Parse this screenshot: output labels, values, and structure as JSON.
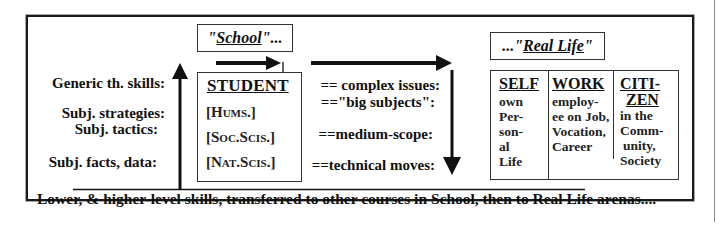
{
  "diagram": {
    "school_title": {
      "quote_open": "\"",
      "word": "School",
      "suffix": "\"..."
    },
    "real_life_title": {
      "prefix": "...\"",
      "word": "Real Life",
      "quote_close": "\""
    },
    "left_labels": [
      "Generic th. skills:",
      "Subj. strategies:",
      "Subj. tactics:",
      "Subj. facts, data:"
    ],
    "student_box": {
      "title": "STUDENT",
      "subjects": [
        "[Hums.]",
        "[Soc.Scis.]",
        "[Nat.Scis.]"
      ]
    },
    "middle_labels": [
      "== complex issues:",
      "==\"big subjects\":",
      "==medium-scope:",
      "==technical moves:"
    ],
    "arenas": [
      {
        "title": "SELF",
        "lines": [
          "own",
          "Per-",
          "son-",
          "al",
          "Life"
        ]
      },
      {
        "title": "WORK",
        "lines": [
          "employ-",
          "ee on Job,",
          "Vocation,",
          "Career"
        ]
      },
      {
        "title_lines": [
          "CITI-",
          "ZEN"
        ],
        "lines": [
          "in the",
          "Comm-",
          "unity,",
          "Society"
        ]
      }
    ],
    "bottom_caption": "Lower, & higher-level skills, transferred to other courses in School, then to Real Life arenas....",
    "colors": {
      "ink": "#111111",
      "frame": "#1a1a1a",
      "right_rule": "#8a8a8a"
    }
  }
}
